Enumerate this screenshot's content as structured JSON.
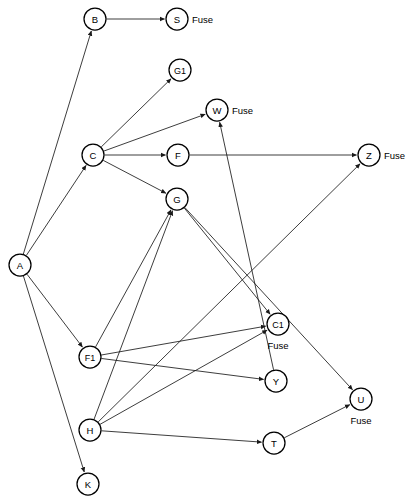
{
  "diagram": {
    "kind": "directed-graph",
    "title_cropped": "",
    "canvas": {
      "width": 415,
      "height": 504
    },
    "node_radius": 11,
    "colors": {
      "node_fill": "#ffffff",
      "node_stroke": "#000000",
      "edge": "#1a1a1a",
      "text": "#000000"
    }
  },
  "nodes": [
    {
      "id": "A",
      "label": "A",
      "x": 20,
      "y": 265,
      "annotation": "",
      "annotation_pos": ""
    },
    {
      "id": "B",
      "label": "B",
      "x": 95,
      "y": 19,
      "annotation": "",
      "annotation_pos": ""
    },
    {
      "id": "S",
      "label": "S",
      "x": 177,
      "y": 19,
      "annotation": "Fuse",
      "annotation_pos": "right"
    },
    {
      "id": "G1",
      "label": "G1",
      "x": 180,
      "y": 70,
      "annotation": "",
      "annotation_pos": ""
    },
    {
      "id": "W",
      "label": "W",
      "x": 217,
      "y": 110,
      "annotation": "Fuse",
      "annotation_pos": "right"
    },
    {
      "id": "C",
      "label": "C",
      "x": 93,
      "y": 155,
      "annotation": "",
      "annotation_pos": ""
    },
    {
      "id": "F",
      "label": "F",
      "x": 178,
      "y": 155,
      "annotation": "",
      "annotation_pos": ""
    },
    {
      "id": "Z",
      "label": "Z",
      "x": 369,
      "y": 155,
      "annotation": "Fuse",
      "annotation_pos": "right"
    },
    {
      "id": "G",
      "label": "G",
      "x": 177,
      "y": 199,
      "annotation": "",
      "annotation_pos": ""
    },
    {
      "id": "C1",
      "label": "C1",
      "x": 278,
      "y": 324,
      "annotation": "Fuse",
      "annotation_pos": "below"
    },
    {
      "id": "F1",
      "label": "F1",
      "x": 90,
      "y": 357,
      "annotation": "",
      "annotation_pos": ""
    },
    {
      "id": "Y",
      "label": "Y",
      "x": 276,
      "y": 381,
      "annotation": "",
      "annotation_pos": ""
    },
    {
      "id": "U",
      "label": "U",
      "x": 361,
      "y": 399,
      "annotation": "Fuse",
      "annotation_pos": "below"
    },
    {
      "id": "H",
      "label": "H",
      "x": 90,
      "y": 430,
      "annotation": "",
      "annotation_pos": ""
    },
    {
      "id": "T",
      "label": "T",
      "x": 274,
      "y": 443,
      "annotation": "",
      "annotation_pos": ""
    },
    {
      "id": "K",
      "label": "K",
      "x": 88,
      "y": 484,
      "annotation": "",
      "annotation_pos": ""
    }
  ],
  "edges": [
    {
      "from": "B",
      "to": "S"
    },
    {
      "from": "A",
      "to": "B"
    },
    {
      "from": "A",
      "to": "C"
    },
    {
      "from": "A",
      "to": "F1"
    },
    {
      "from": "A",
      "to": "K"
    },
    {
      "from": "C",
      "to": "G1"
    },
    {
      "from": "C",
      "to": "W"
    },
    {
      "from": "C",
      "to": "F"
    },
    {
      "from": "C",
      "to": "G"
    },
    {
      "from": "F",
      "to": "Z"
    },
    {
      "from": "F1",
      "to": "G"
    },
    {
      "from": "F1",
      "to": "C1"
    },
    {
      "from": "F1",
      "to": "Y"
    },
    {
      "from": "G",
      "to": "C1"
    },
    {
      "from": "G",
      "to": "U"
    },
    {
      "from": "H",
      "to": "G"
    },
    {
      "from": "H",
      "to": "C1"
    },
    {
      "from": "H",
      "to": "T"
    },
    {
      "from": "H",
      "to": "Z"
    },
    {
      "from": "T",
      "to": "U"
    },
    {
      "from": "Y",
      "to": "W"
    }
  ]
}
